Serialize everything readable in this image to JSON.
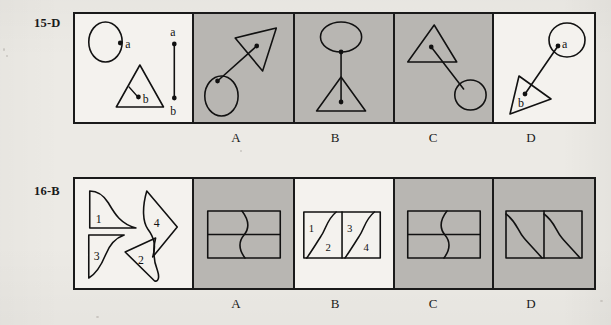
{
  "page": {
    "background_color": "#eceae5",
    "ink_color": "#111111",
    "shaded_panel_color": "#b8b6b2",
    "plain_panel_color": "#f4f2ee"
  },
  "rows": [
    {
      "id": "row-15",
      "label": "15-D",
      "question_number": "15",
      "answer_key": "D",
      "option_letters": [
        "A",
        "B",
        "C",
        "D"
      ],
      "panels": [
        {
          "key": "prompt",
          "shaded": false,
          "description": "circle with point a on its right edge, triangle with point b inside, and a vertical segment labelled a at top and b at bottom",
          "marks": [
            "a",
            "b",
            "a",
            "b"
          ]
        },
        {
          "key": "A",
          "shaded": true,
          "description": "triangle upper-right with interior point, ellipse lower-left, diagonal segment joining them, segment crosses triangle edge"
        },
        {
          "key": "B",
          "shaded": true,
          "description": "ellipse on top, vertical segment down to triangle with interior point"
        },
        {
          "key": "C",
          "shaded": true,
          "description": "triangle upper-left with interior point, ellipse lower-right, diagonal segment joining them"
        },
        {
          "key": "D",
          "shaded": false,
          "description": "ellipse upper-right labelled a, tilted triangle lower-left labelled b, diagonal segment joining point a to point b",
          "marks": [
            "a",
            "b"
          ]
        }
      ]
    },
    {
      "id": "row-16",
      "label": "16-B",
      "question_number": "16",
      "answer_key": "B",
      "option_letters": [
        "A",
        "B",
        "C",
        "D"
      ],
      "panels": [
        {
          "key": "prompt",
          "shaded": false,
          "description": "four scattered pieces numbered 1 to 4, each bounded by two straight edges and one S-curve",
          "marks": [
            "1",
            "2",
            "3",
            "4"
          ]
        },
        {
          "key": "A",
          "shaded": true,
          "description": "wide rectangle divided by a horizontal line, single vertical S-curve crossing it"
        },
        {
          "key": "B",
          "shaded": false,
          "description": "rectangle divided by a vertical line into two squares, each containing an S-curve; quarters numbered 1,2 and 3,4",
          "marks": [
            "1",
            "2",
            "3",
            "4"
          ]
        },
        {
          "key": "C",
          "shaded": true,
          "description": "wide rectangle divided by a horizontal line, mirrored vertical S-curve crossing it"
        },
        {
          "key": "D",
          "shaded": true,
          "description": "two squares side by side, each with an S-curve running from top-left to bottom-right"
        }
      ]
    }
  ]
}
